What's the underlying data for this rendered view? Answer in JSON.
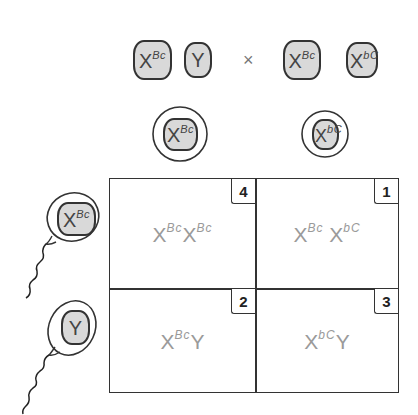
{
  "parents": {
    "male": {
      "chromosomes": [
        {
          "base": "X",
          "superscript": "Bc"
        },
        {
          "base": "Y",
          "superscript": ""
        }
      ]
    },
    "cross_symbol": "×",
    "female": {
      "chromosomes": [
        {
          "base": "X",
          "superscript": "Bc"
        },
        {
          "base": "X",
          "superscript": "bC"
        }
      ]
    }
  },
  "eggs": [
    {
      "base": "X",
      "superscript": "Bc"
    },
    {
      "base": "X",
      "superscript": "bC"
    }
  ],
  "sperm": [
    {
      "base": "X",
      "superscript": "Bc"
    },
    {
      "base": "Y",
      "superscript": ""
    }
  ],
  "punnett": {
    "cells": [
      {
        "number": "4",
        "genotype": [
          {
            "base": "X",
            "sup": "Bc"
          },
          {
            "base": "X",
            "sup": "Bc"
          }
        ]
      },
      {
        "number": "1",
        "genotype": [
          {
            "base": "X",
            "sup": "Bc"
          },
          {
            "base": " X",
            "sup": "bC"
          }
        ]
      },
      {
        "number": "2",
        "genotype": [
          {
            "base": "X",
            "sup": "Bc"
          },
          {
            "base": "Y",
            "sup": ""
          }
        ]
      },
      {
        "number": "3",
        "genotype": [
          {
            "base": "X",
            "sup": "bC"
          },
          {
            "base": "Y",
            "sup": ""
          }
        ]
      }
    ]
  },
  "colors": {
    "chromosome_fill": "#d9d9d9",
    "outline": "#333333",
    "genotype_text": "#9a9a9a"
  }
}
